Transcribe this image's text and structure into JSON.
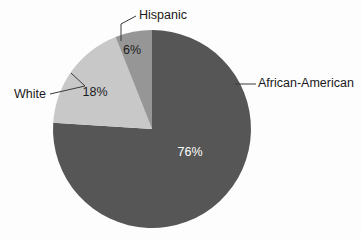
{
  "chart_data": {
    "type": "pie",
    "title": "",
    "subtitle": "",
    "xlabel": "",
    "ylabel": "",
    "legend_position": "callout-labels",
    "grid": false,
    "categories": [
      "African-American",
      "White",
      "Hispanic"
    ],
    "values": [
      76,
      18,
      6
    ],
    "unit": "%",
    "start_angle_deg": 0,
    "direction": "clockwise",
    "slices": [
      {
        "label": "African-American",
        "value": 76,
        "value_label": "76%",
        "color": "#565656",
        "value_text_color": "#ffffff"
      },
      {
        "label": "White",
        "value": 18,
        "value_label": "18%",
        "color": "#c8c8c8",
        "value_text_color": "#1a1a1a"
      },
      {
        "label": "Hispanic",
        "value": 6,
        "value_label": "6%",
        "color": "#969696",
        "value_text_color": "#1a1a1a"
      }
    ]
  },
  "figure": {
    "background_color": "#fdfdfd",
    "center_x": 152,
    "center_y": 129,
    "radius": 99
  },
  "labels": {
    "hispanic": "Hispanic",
    "white": "White",
    "african_american": "African-American"
  },
  "value_labels": {
    "hispanic": "6%",
    "white": "18%",
    "african_american": "76%"
  }
}
